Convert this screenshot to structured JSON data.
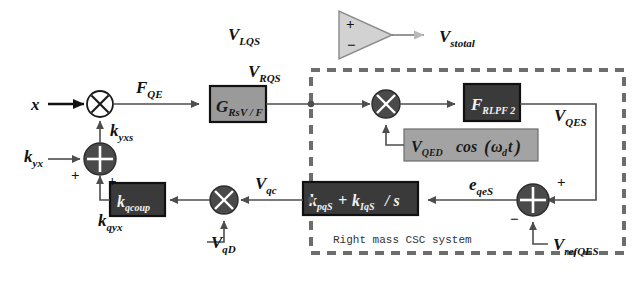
{
  "diagram": {
    "boundary_caption": "Right mass CSC system",
    "signals": {
      "input_x": "x",
      "force_qe": "F",
      "force_qe_sub": "QE",
      "v_lqs": "V",
      "v_lqs_sub": "LQS",
      "v_rqs": "V",
      "v_rqs_sub": "RQS",
      "v_stotal": "V",
      "v_stotal_sub": "stotal",
      "v_qes": "V",
      "v_qes_sub": "QES",
      "e_qes": "e",
      "e_qes_sub": "qeS",
      "v_qc": "V",
      "v_qc_sub": "qc",
      "v_qd": "V",
      "v_qd_sub": "qD",
      "v_refqes": "V",
      "v_refqes_sub": "refQES",
      "k_yxs": "k",
      "k_yxs_sub": "yxs",
      "k_yx": "k",
      "k_yx_sub": "yx",
      "k_qyx": "k",
      "k_qyx_sub": "qyx"
    },
    "blocks": [
      {
        "name": "gain-rsvf",
        "main": "G",
        "sub": "RsV / F"
      },
      {
        "name": "filter-rlpf2",
        "main": "F",
        "sub": "RLPF 2"
      },
      {
        "name": "carrier-source",
        "text": "V",
        "sub": "QED",
        "expr": "cos(ω t)",
        "omega_sub": "d"
      },
      {
        "name": "pi-controller",
        "p_main": "k",
        "p_sub": "pqS",
        "plus": "+",
        "i_main": "k",
        "i_sub": "IqS",
        "over_s": "/ s"
      },
      {
        "name": "cross-coupling",
        "main": "k",
        "sub": "qcoup"
      }
    ],
    "signs": {
      "sum1_left": "+",
      "sum1_bottom": "+",
      "sum2_right": "+",
      "sum2_bottom": "−",
      "amp_plus": "+",
      "amp_minus": "−"
    },
    "colors": {
      "block_fill": "#9a9a9a",
      "block_fill_dark": "#3a3a3a",
      "junction_fill": "#4a4a4a",
      "wire": "#4d4d4d",
      "boundary": "#6d6d6d",
      "background": "#ffffff"
    }
  }
}
